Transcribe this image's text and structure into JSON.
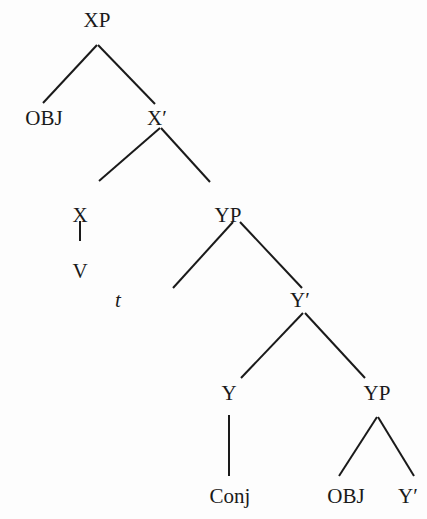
{
  "diagram": {
    "type": "syntax-tree",
    "nodes": [
      {
        "id": "xp",
        "label": "XP",
        "x": 97,
        "y": 27
      },
      {
        "id": "obj1",
        "label": "OBJ",
        "x": 44,
        "y": 125
      },
      {
        "id": "xbar",
        "label": "X′",
        "x": 157,
        "y": 125
      },
      {
        "id": "x",
        "label": "X",
        "x": 80,
        "y": 222
      },
      {
        "id": "yp1",
        "label": "YP",
        "x": 228,
        "y": 222
      },
      {
        "id": "v",
        "label": "V",
        "x": 80,
        "y": 278
      },
      {
        "id": "t",
        "label": "t",
        "x": 118,
        "y": 307
      },
      {
        "id": "ybar1",
        "label": "Y′",
        "x": 300,
        "y": 307
      },
      {
        "id": "y",
        "label": "Y",
        "x": 229,
        "y": 400
      },
      {
        "id": "yp2",
        "label": "YP",
        "x": 377,
        "y": 400
      },
      {
        "id": "conj",
        "label": "Conj",
        "x": 230,
        "y": 503
      },
      {
        "id": "obj2",
        "label": "OBJ",
        "x": 346,
        "y": 503
      },
      {
        "id": "ybar2",
        "label": "Y′",
        "x": 408,
        "y": 503
      }
    ],
    "edges": [
      {
        "from": "xp",
        "to": "obj1",
        "x1": 97,
        "y1": 45,
        "x2": 43,
        "y2": 103
      },
      {
        "from": "xp",
        "to": "xbar",
        "x1": 98,
        "y1": 45,
        "x2": 155,
        "y2": 104
      },
      {
        "from": "xbar",
        "to": "x",
        "x1": 160,
        "y1": 128,
        "x2": 99,
        "y2": 181
      },
      {
        "from": "xbar",
        "to": "yp1",
        "x1": 161,
        "y1": 128,
        "x2": 210,
        "y2": 182
      },
      {
        "from": "x",
        "to": "v",
        "x1": 80,
        "y1": 221,
        "x2": 80,
        "y2": 241
      },
      {
        "from": "yp1",
        "to": "t",
        "x1": 233,
        "y1": 222,
        "x2": 173,
        "y2": 288
      },
      {
        "from": "yp1",
        "to": "ybar1",
        "x1": 240,
        "y1": 222,
        "x2": 302,
        "y2": 288
      },
      {
        "from": "ybar1",
        "to": "y",
        "x1": 303,
        "y1": 313,
        "x2": 241,
        "y2": 378
      },
      {
        "from": "ybar1",
        "to": "yp2",
        "x1": 305,
        "y1": 313,
        "x2": 365,
        "y2": 378
      },
      {
        "from": "y",
        "to": "conj",
        "x1": 229,
        "y1": 415,
        "x2": 229,
        "y2": 476
      },
      {
        "from": "yp2",
        "to": "obj2",
        "x1": 377,
        "y1": 417,
        "x2": 339,
        "y2": 476
      },
      {
        "from": "yp2",
        "to": "ybar2",
        "x1": 378,
        "y1": 417,
        "x2": 414,
        "y2": 476
      }
    ]
  }
}
